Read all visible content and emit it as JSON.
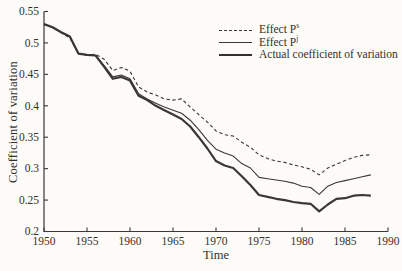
{
  "figure": {
    "background": "#fcfbf8",
    "ink": "#3a3834",
    "text_color": "#33312d"
  },
  "chart_data": {
    "type": "line",
    "title": "",
    "xlabel": "Time",
    "ylabel": "Coefficient of variation",
    "xlim": [
      1950,
      1990
    ],
    "ylim": [
      0.2,
      0.55
    ],
    "grid": false,
    "legend_position": "top-right-inside",
    "xticks": [
      1950,
      1955,
      1960,
      1965,
      1970,
      1975,
      1980,
      1985,
      1990
    ],
    "xtick_labels": [
      "1950",
      "1955",
      "1960",
      "1965",
      "1970",
      "1975",
      "1980",
      "1985",
      "1990"
    ],
    "yticks": [
      0.2,
      0.25,
      0.3,
      0.35,
      0.4,
      0.45,
      0.5,
      0.55
    ],
    "ytick_labels": [
      "0.2",
      "0.25",
      "0.3",
      "0.35",
      "0.4",
      "0.45",
      "0.5",
      "0.55"
    ],
    "x": [
      1950,
      1951,
      1952,
      1953,
      1954,
      1955,
      1956,
      1957,
      1958,
      1959,
      1960,
      1961,
      1962,
      1963,
      1964,
      1965,
      1966,
      1967,
      1968,
      1969,
      1970,
      1971,
      1972,
      1973,
      1974,
      1975,
      1976,
      1977,
      1978,
      1979,
      1980,
      1981,
      1982,
      1983,
      1984,
      1985,
      1986,
      1987,
      1988
    ],
    "series": [
      {
        "name": "Effect P^s",
        "label": "Effect P",
        "sup": "s",
        "slug": "effect-ps",
        "style": "dashed",
        "width": 1.1,
        "values": [
          0.53,
          0.524,
          0.516,
          0.508,
          0.483,
          0.48,
          0.482,
          0.474,
          0.456,
          0.461,
          0.455,
          0.43,
          0.422,
          0.417,
          0.411,
          0.409,
          0.411,
          0.398,
          0.386,
          0.374,
          0.36,
          0.354,
          0.352,
          0.342,
          0.334,
          0.322,
          0.316,
          0.312,
          0.31,
          0.306,
          0.303,
          0.299,
          0.29,
          0.301,
          0.307,
          0.313,
          0.318,
          0.321,
          0.322
        ]
      },
      {
        "name": "Effect P^j",
        "label": "Effect P",
        "sup": "j",
        "slug": "effect-pj",
        "style": "solid",
        "width": 1.1,
        "values": [
          0.53,
          0.525,
          0.517,
          0.51,
          0.483,
          0.481,
          0.48,
          0.464,
          0.446,
          0.449,
          0.443,
          0.419,
          0.411,
          0.404,
          0.398,
          0.393,
          0.388,
          0.377,
          0.362,
          0.345,
          0.331,
          0.325,
          0.32,
          0.308,
          0.301,
          0.286,
          0.284,
          0.282,
          0.28,
          0.277,
          0.272,
          0.27,
          0.259,
          0.272,
          0.278,
          0.281,
          0.284,
          0.287,
          0.29
        ]
      },
      {
        "name": "Actual coefficient of variation",
        "label": "Actual coefficient of variation",
        "sup": "",
        "slug": "actual-cv",
        "style": "solid",
        "width": 2.2,
        "values": [
          0.53,
          0.525,
          0.517,
          0.51,
          0.483,
          0.481,
          0.48,
          0.462,
          0.443,
          0.446,
          0.44,
          0.416,
          0.409,
          0.4,
          0.393,
          0.386,
          0.379,
          0.367,
          0.35,
          0.332,
          0.312,
          0.305,
          0.301,
          0.288,
          0.274,
          0.258,
          0.255,
          0.252,
          0.25,
          0.247,
          0.245,
          0.244,
          0.232,
          0.243,
          0.252,
          0.253,
          0.257,
          0.258,
          0.257
        ]
      }
    ]
  }
}
